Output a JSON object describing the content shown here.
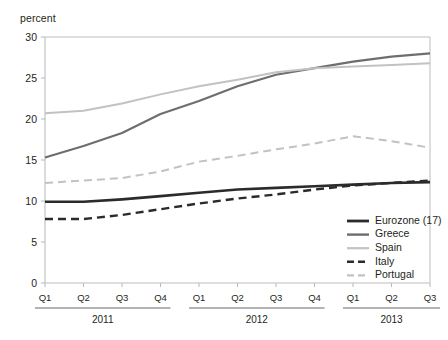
{
  "figure": {
    "clipped_title_fragment": "",
    "y_axis_unit_label": "percent"
  },
  "chart_data": {
    "type": "line",
    "title": "",
    "subtitle": "",
    "xlabel": "",
    "ylabel": "percent",
    "ylim": [
      0,
      30
    ],
    "yticks": [
      0,
      5,
      10,
      15,
      20,
      25,
      30
    ],
    "ytick_labels": [
      "0",
      "5",
      "10",
      "15",
      "20",
      "25",
      "30"
    ],
    "grid": false,
    "legend_position": "inside-bottom-right",
    "x": [
      "Q1",
      "Q2",
      "Q3",
      "Q4",
      "Q1",
      "Q2",
      "Q3",
      "Q4",
      "Q1",
      "Q2",
      "Q3"
    ],
    "categories": [
      "Q1",
      "Q2",
      "Q3",
      "Q4",
      "Q1",
      "Q2",
      "Q3",
      "Q4",
      "Q1",
      "Q2",
      "Q3"
    ],
    "x_groups": [
      {
        "label": "2011",
        "quarters": [
          "Q1",
          "Q2",
          "Q3",
          "Q4"
        ],
        "start_index": 0,
        "end_index": 3
      },
      {
        "label": "2012",
        "quarters": [
          "Q1",
          "Q2",
          "Q3",
          "Q4"
        ],
        "start_index": 4,
        "end_index": 7
      },
      {
        "label": "2013",
        "quarters": [
          "Q1",
          "Q2",
          "Q3"
        ],
        "start_index": 8,
        "end_index": 10
      }
    ],
    "series": [
      {
        "name": "Eurozone (17)",
        "color": "#2b2b2b",
        "width": 2.6,
        "dash": "none",
        "values": [
          9.9,
          9.9,
          10.2,
          10.6,
          11.0,
          11.4,
          11.6,
          11.8,
          12.0,
          12.2,
          12.3
        ]
      },
      {
        "name": "Greece",
        "color": "#6e6e6e",
        "width": 2.2,
        "dash": "none",
        "values": [
          15.3,
          16.7,
          18.3,
          20.6,
          22.2,
          24.0,
          25.4,
          26.2,
          27.0,
          27.6,
          28.0
        ]
      },
      {
        "name": "Spain",
        "color": "#c2c2c2",
        "width": 2.0,
        "dash": "none",
        "values": [
          20.7,
          21.0,
          21.9,
          23.0,
          24.0,
          24.8,
          25.7,
          26.2,
          26.4,
          26.6,
          26.8
        ]
      },
      {
        "name": "Italy",
        "color": "#2b2b2b",
        "width": 2.4,
        "dash": "8,5",
        "values": [
          7.8,
          7.8,
          8.3,
          9.0,
          9.7,
          10.3,
          10.8,
          11.4,
          11.9,
          12.2,
          12.5
        ]
      },
      {
        "name": "Portugal",
        "color": "#c2c2c2",
        "width": 2.0,
        "dash": "8,5",
        "values": [
          12.2,
          12.5,
          12.8,
          13.6,
          14.8,
          15.5,
          16.3,
          17.0,
          17.9,
          17.3,
          16.5
        ]
      }
    ],
    "legend_entries": [
      {
        "label": "Eurozone (17)",
        "color": "#2b2b2b",
        "dash": "none",
        "width": 2.8
      },
      {
        "label": "Greece",
        "color": "#6e6e6e",
        "dash": "none",
        "width": 2.4
      },
      {
        "label": "Spain",
        "color": "#c2c2c2",
        "dash": "none",
        "width": 2.2
      },
      {
        "label": "Italy",
        "color": "#2b2b2b",
        "dash": "7,4",
        "width": 2.6
      },
      {
        "label": "Portugal",
        "color": "#c2c2c2",
        "dash": "7,4",
        "width": 2.2
      }
    ],
    "colors": {
      "axis": "#bdbdbd",
      "text": "#231f20",
      "eurozone": "#2b2b2b",
      "greece": "#6e6e6e",
      "spain": "#c2c2c2",
      "italy": "#2b2b2b",
      "portugal": "#c2c2c2",
      "background": "#ffffff"
    }
  }
}
